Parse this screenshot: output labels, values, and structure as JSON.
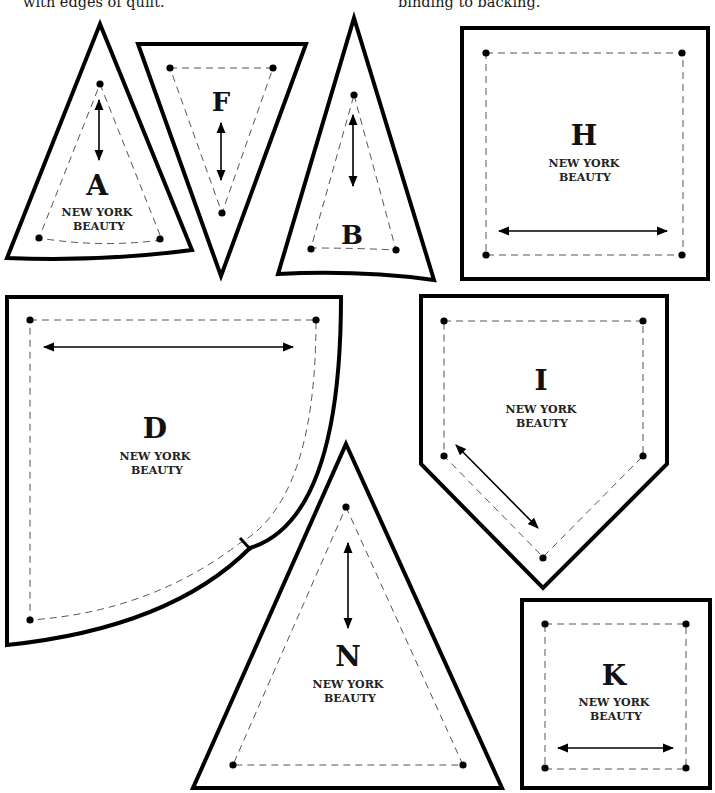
{
  "captions": {
    "left": "with edges of quilt.",
    "right": "binding to backing."
  },
  "pattern_label": "NEW YORK",
  "pattern_label_line2": "BEAUTY",
  "pieces": {
    "A": {
      "letter": "A",
      "line1": "NEW YORK",
      "line2": "BEAUTY",
      "grain": "vertical"
    },
    "F": {
      "letter": "F",
      "grain": "vertical"
    },
    "B": {
      "letter": "B",
      "grain": "vertical"
    },
    "H": {
      "letter": "H",
      "line1": "NEW YORK",
      "line2": "BEAUTY",
      "grain": "horizontal"
    },
    "D": {
      "letter": "D",
      "line1": "NEW YORK",
      "line2": "BEAUTY",
      "grain": "horizontal"
    },
    "I": {
      "letter": "I",
      "line1": "NEW YORK",
      "line2": "BEAUTY",
      "grain": "diagonal"
    },
    "N": {
      "letter": "N",
      "line1": "NEW YORK",
      "line2": "BEAUTY",
      "grain": "vertical"
    },
    "K": {
      "letter": "K",
      "line1": "NEW YORK",
      "line2": "BEAUTY",
      "grain": "horizontal"
    }
  }
}
